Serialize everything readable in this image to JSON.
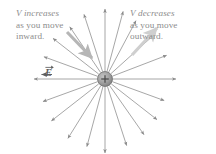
{
  "figure": {
    "background_color": "#ffffff",
    "width": 216,
    "height": 154
  },
  "annotations": {
    "left": {
      "line1": "V increases",
      "line2": "as you move",
      "line3": "inward.",
      "color": "#8d8d8d",
      "pointer": "thick-gray-arrow-down-right"
    },
    "right": {
      "line1": "V decreases",
      "line2": "as you move",
      "line3": "outward.",
      "color": "#8d8d8d",
      "pointer": "thick-gray-arrow-up-right"
    }
  },
  "field_label": {
    "symbol": "E",
    "accent": "vector-arrow",
    "color": "#5f5f5f"
  },
  "charge": {
    "sign": "+",
    "center_x": 105,
    "center_y": 79,
    "radius": 7.5,
    "fill_color": "#9a9a9a",
    "edge_color": "#6b6b6b"
  },
  "chart_data": {
    "type": "scatter",
    "xlabel": "",
    "ylabel": "",
    "center": [
      105,
      79
    ],
    "inner_radius": 8,
    "line_color": "#8a8a8a",
    "field_lines": [
      {
        "angle_deg": 0,
        "length": 63
      },
      {
        "angle_deg": 21,
        "length": 58
      },
      {
        "angle_deg": 42,
        "length": 60
      },
      {
        "angle_deg": 62,
        "length": 58
      },
      {
        "angle_deg": 75,
        "length": 62
      },
      {
        "angle_deg": 90,
        "length": 62
      },
      {
        "angle_deg": 108,
        "length": 60
      },
      {
        "angle_deg": 124,
        "length": 55
      },
      {
        "angle_deg": 142,
        "length": 58
      },
      {
        "angle_deg": 160,
        "length": 57
      },
      {
        "angle_deg": 180,
        "length": 63
      },
      {
        "angle_deg": 200,
        "length": 58
      },
      {
        "angle_deg": 218,
        "length": 60
      },
      {
        "angle_deg": 238,
        "length": 62
      },
      {
        "angle_deg": 255,
        "length": 62
      },
      {
        "angle_deg": 270,
        "length": 66
      },
      {
        "angle_deg": 288,
        "length": 62
      },
      {
        "angle_deg": 305,
        "length": 60
      },
      {
        "angle_deg": 322,
        "length": 58
      },
      {
        "angle_deg": 340,
        "length": 55
      }
    ],
    "pointer_arrows": [
      {
        "name": "left-pointer",
        "x1": 67,
        "y1": 32,
        "x2": 92,
        "y2": 58,
        "color": "#b6b6b6"
      },
      {
        "name": "right-pointer",
        "x1": 132,
        "y1": 55,
        "x2": 157,
        "y2": 28,
        "color": "#cfcfcf"
      }
    ]
  }
}
